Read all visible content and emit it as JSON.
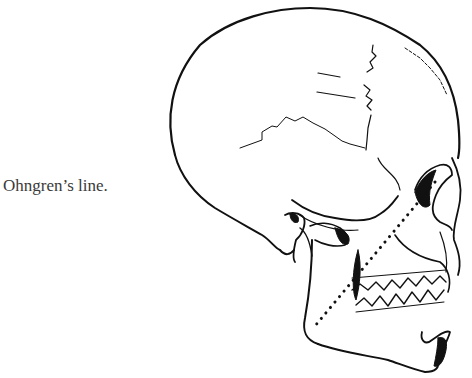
{
  "figure": {
    "caption": "Ohngren’s line.",
    "line": {
      "name": "Ohngren's line",
      "style": "dotted",
      "start": {
        "x": 435,
        "y": 182
      },
      "end": {
        "x": 315,
        "y": 326
      }
    },
    "colors": {
      "ink": "#111111",
      "text": "#3a3a3a",
      "background": "#ffffff"
    }
  }
}
